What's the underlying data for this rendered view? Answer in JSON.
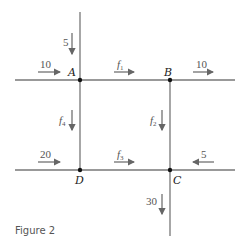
{
  "figure": {
    "caption": "Figure 2",
    "nodes": [
      {
        "id": "A",
        "label": "A",
        "x": 80,
        "y": 80
      },
      {
        "id": "B",
        "label": "B",
        "x": 170,
        "y": 80
      },
      {
        "id": "C",
        "label": "C",
        "x": 170,
        "y": 170
      },
      {
        "id": "D",
        "label": "D",
        "x": 80,
        "y": 170
      }
    ],
    "external_flows": [
      {
        "id": "in_A_top",
        "value": "5",
        "direction": "down",
        "node": "A"
      },
      {
        "id": "in_A_left",
        "value": "10",
        "direction": "right",
        "node": "A"
      },
      {
        "id": "out_B_right",
        "value": "10",
        "direction": "right",
        "node": "B"
      },
      {
        "id": "in_D_left",
        "value": "20",
        "direction": "right",
        "node": "D"
      },
      {
        "id": "in_C_right",
        "value": "5",
        "direction": "left",
        "node": "C"
      },
      {
        "id": "out_C_bottom",
        "value": "30",
        "direction": "down",
        "node": "C"
      }
    ],
    "internal_flows": [
      {
        "id": "f1",
        "label": "f",
        "sub": "1",
        "from": "A",
        "to": "B"
      },
      {
        "id": "f2",
        "label": "f",
        "sub": "2",
        "from": "B",
        "to": "C"
      },
      {
        "id": "f3",
        "label": "f",
        "sub": "3",
        "from": "D",
        "to": "C"
      },
      {
        "id": "f4",
        "label": "f",
        "sub": "4",
        "from": "A",
        "to": "D"
      }
    ]
  }
}
